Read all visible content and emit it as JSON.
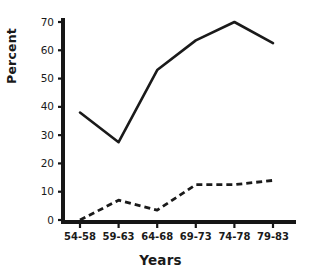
{
  "chart_data": {
    "type": "line",
    "title": "",
    "xlabel": "Years",
    "ylabel": "Percent",
    "categories": [
      "54-58",
      "59-63",
      "64-68",
      "69-73",
      "74-78",
      "79-83"
    ],
    "series": [
      {
        "name": "solid-line",
        "style": "solid",
        "color": "#1a1a1a",
        "values": [
          38,
          27.5,
          53,
          63.5,
          70,
          62.5
        ]
      },
      {
        "name": "dashed-line",
        "style": "dashed",
        "color": "#1a1a1a",
        "values": [
          0,
          7,
          3.5,
          12.5,
          12.5,
          14
        ]
      }
    ],
    "ylim": [
      0,
      72
    ],
    "yticks": [
      0,
      10,
      20,
      30,
      40,
      50,
      60,
      70
    ],
    "ytick_labels": [
      "0",
      "10",
      "20",
      "30",
      "40",
      "50",
      "60",
      "70"
    ],
    "grid": false,
    "legend": "none"
  },
  "axes": {
    "x_title": "Years",
    "y_title": "Percent"
  }
}
